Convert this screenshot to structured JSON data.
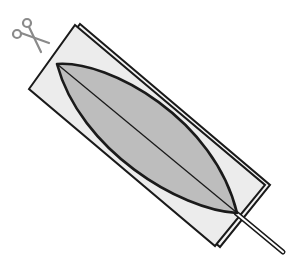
{
  "diagram": {
    "colors": {
      "background": "#ffffff",
      "paper": "#ececec",
      "leaf_fill": "#bdbdbd",
      "outline": "#1a1a1a",
      "scissors": "#8a8a8a"
    },
    "icons": [
      "scissors-icon"
    ]
  }
}
